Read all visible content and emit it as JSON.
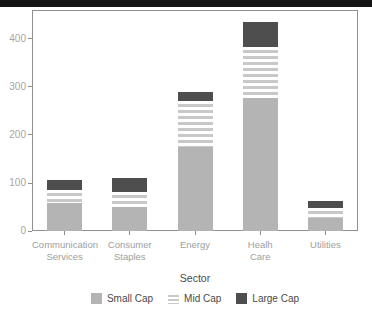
{
  "window": {
    "top_bar_color": "#141414"
  },
  "chart_data": {
    "type": "bar",
    "stacked": true,
    "title": "",
    "xlabel": "Sector",
    "ylabel": "",
    "ylim": [
      0,
      460
    ],
    "yticks": [
      0,
      100,
      200,
      300,
      400
    ],
    "grid": false,
    "legend_position": "bottom",
    "categories": [
      {
        "label_lines": [
          "Communication",
          "Services"
        ]
      },
      {
        "label_lines": [
          "Consumer",
          "Staples"
        ]
      },
      {
        "label_lines": [
          "Energy"
        ]
      },
      {
        "label_lines": [
          "Healh",
          "Care"
        ]
      },
      {
        "label_lines": [
          "Utilities"
        ]
      }
    ],
    "series": [
      {
        "name": "Small Cap",
        "style": "solid-light",
        "values": [
          58,
          50,
          175,
          277,
          27
        ]
      },
      {
        "name": "Mid Cap",
        "style": "striped",
        "values": [
          27,
          31,
          96,
          106,
          21
        ]
      },
      {
        "name": "Large Cap",
        "style": "solid-dark",
        "values": [
          21,
          29,
          19,
          52,
          15
        ]
      }
    ],
    "totals": [
      106,
      110,
      290,
      435,
      63
    ]
  },
  "colors": {
    "small_cap": "#b4b4b4",
    "mid_cap_stripe": "#c8c8c8",
    "large_cap": "#4e4e4e",
    "axis": "#8f8f8f",
    "tick_label": "#a5a5a5",
    "text": "#4a4a4a",
    "top_bar": "#141414",
    "background": "#ffffff"
  }
}
